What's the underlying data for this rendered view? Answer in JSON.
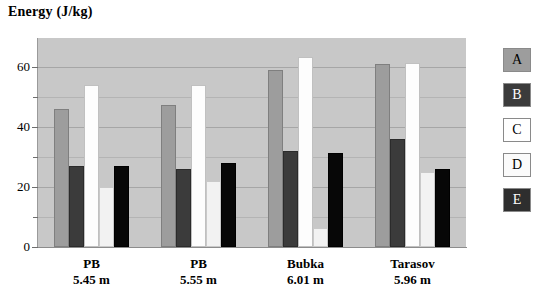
{
  "chart_data": {
    "type": "bar",
    "title": "Energy (J/kg)",
    "xlabel": "",
    "ylabel": "Energy (J/kg)",
    "ylim": [
      0,
      70
    ],
    "yticks": [
      0,
      20,
      40,
      60
    ],
    "yticks_minor": [
      10,
      30,
      50
    ],
    "grid": true,
    "legend_position": "right",
    "categories": [
      "PB",
      "PB",
      "Bubka",
      "Tarasov"
    ],
    "category_sublabels": [
      "5.45 m",
      "5.55 m",
      "6.01 m",
      "5.96 m"
    ],
    "series": [
      {
        "name": "A",
        "color": "#9d9d9d",
        "values": [
          46,
          47.5,
          59,
          61
        ]
      },
      {
        "name": "B",
        "color": "#3b3b3b",
        "values": [
          27,
          26,
          32,
          36
        ]
      },
      {
        "name": "C",
        "color": "#ffffff",
        "values": [
          54,
          54,
          63.5,
          61.5
        ]
      },
      {
        "name": "D",
        "color": "#fbfbfb",
        "values": [
          20,
          22,
          6.5,
          25
        ]
      },
      {
        "name": "E",
        "color": "#070707",
        "values": [
          27,
          28,
          31.5,
          26
        ]
      }
    ]
  },
  "legend": {
    "items": [
      {
        "label": "A"
      },
      {
        "label": "B"
      },
      {
        "label": "C"
      },
      {
        "label": "D"
      },
      {
        "label": "E"
      }
    ]
  },
  "axis": {
    "y_tick_labels": [
      "60",
      "40",
      "20",
      "0"
    ]
  }
}
